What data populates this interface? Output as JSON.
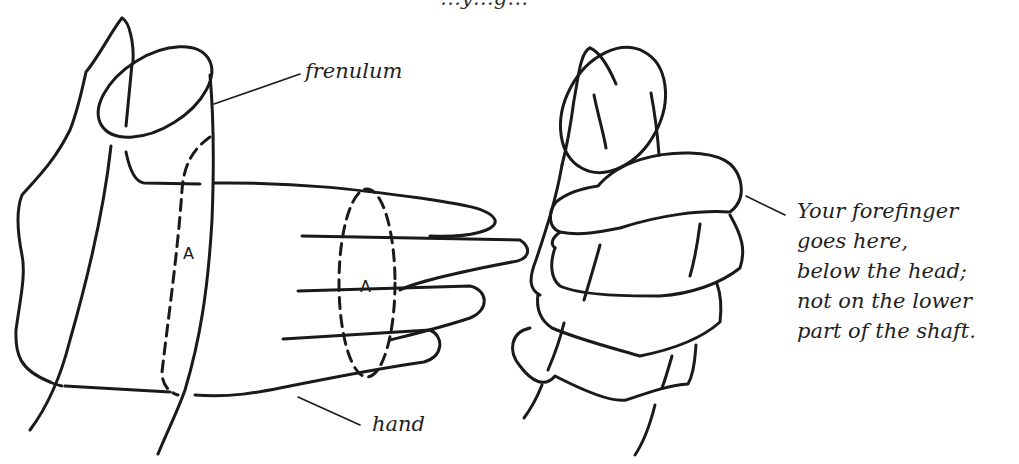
{
  "figure": {
    "caption_clipped": "…y…g…",
    "left_illustration": {
      "labels": {
        "frenulum": "frenulum",
        "hand": "hand",
        "marker_shaft": "A",
        "marker_hand": "A"
      }
    },
    "right_illustration": {
      "note_lines": [
        "Your forefinger",
        "goes here,",
        "below the head;",
        "not on the lower",
        "part of the shaft."
      ]
    },
    "colors": {
      "ink": "#1a1a1a",
      "text": "#1f1f1f",
      "background": "#ffffff"
    }
  }
}
